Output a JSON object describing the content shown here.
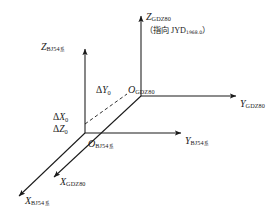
{
  "figure": {
    "type": "coordinate-transformation-diagram",
    "background": "#ffffff",
    "line_color": "#1a1a1a"
  },
  "axes": {
    "gdz80": {
      "z": {
        "symbol": "Z",
        "subscript": "GDZ80"
      },
      "y": {
        "symbol": "Y",
        "subscript": "GDZ80"
      },
      "x": {
        "symbol": "X",
        "subscript": "GDZ80"
      },
      "origin": {
        "symbol": "O",
        "subscript": "GDZ80"
      },
      "z_note": {
        "open": "（",
        "text": "指向",
        "latin": "JYD",
        "sub": "1968.0",
        "close": "）"
      }
    },
    "bj54": {
      "z": {
        "symbol": "Z",
        "subscript": "BJ54",
        "system_mark": "系"
      },
      "y": {
        "symbol": "Y",
        "subscript": "BJ54",
        "system_mark": "系"
      },
      "x": {
        "symbol": "X",
        "subscript": "BJ54",
        "system_mark": "系"
      },
      "origin": {
        "symbol": "O",
        "subscript": "BJ54",
        "system_mark": "系"
      }
    }
  },
  "offsets": [
    {
      "symbol": "Δ",
      "axis": "X",
      "subscript": "0"
    },
    {
      "symbol": "Δ",
      "axis": "Y",
      "subscript": "0"
    },
    {
      "symbol": "Δ",
      "axis": "Z",
      "subscript": "0"
    }
  ]
}
